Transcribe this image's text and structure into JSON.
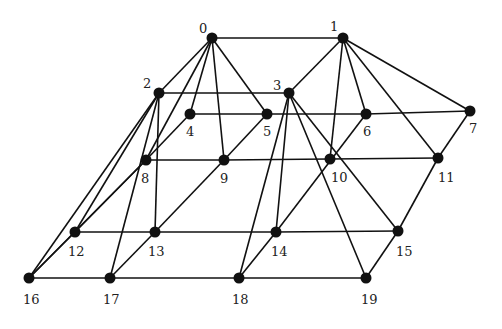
{
  "diagram": {
    "type": "graph",
    "colors": {
      "edge": "#111111",
      "node": "#111111",
      "background": "#ffffff"
    },
    "nodes": [
      {
        "id": "0",
        "label": "0",
        "x": 212,
        "y": 38,
        "lx": 199,
        "ly": 33
      },
      {
        "id": "1",
        "label": "1",
        "x": 343,
        "y": 38,
        "lx": 330,
        "ly": 31
      },
      {
        "id": "2",
        "label": "2",
        "x": 159,
        "y": 93,
        "lx": 143,
        "ly": 88
      },
      {
        "id": "3",
        "label": "3",
        "x": 289,
        "y": 93,
        "lx": 273,
        "ly": 90
      },
      {
        "id": "4",
        "label": "4",
        "x": 190,
        "y": 114,
        "lx": 186,
        "ly": 136
      },
      {
        "id": "5",
        "label": "5",
        "x": 267,
        "y": 114,
        "lx": 263,
        "ly": 136
      },
      {
        "id": "6",
        "label": "6",
        "x": 366,
        "y": 114,
        "lx": 363,
        "ly": 136
      },
      {
        "id": "7",
        "label": "7",
        "x": 470,
        "y": 111,
        "lx": 469,
        "ly": 133
      },
      {
        "id": "8",
        "label": "8",
        "x": 146,
        "y": 160,
        "lx": 141,
        "ly": 183
      },
      {
        "id": "9",
        "label": "9",
        "x": 224,
        "y": 160,
        "lx": 220,
        "ly": 183
      },
      {
        "id": "10",
        "label": "10",
        "x": 330,
        "y": 159,
        "lx": 331,
        "ly": 182
      },
      {
        "id": "11",
        "label": "11",
        "x": 438,
        "y": 158,
        "lx": 438,
        "ly": 182
      },
      {
        "id": "12",
        "label": "12",
        "x": 75,
        "y": 232,
        "lx": 68,
        "ly": 256
      },
      {
        "id": "13",
        "label": "13",
        "x": 155,
        "y": 232,
        "lx": 148,
        "ly": 256
      },
      {
        "id": "14",
        "label": "14",
        "x": 276,
        "y": 232,
        "lx": 271,
        "ly": 256
      },
      {
        "id": "15",
        "label": "15",
        "x": 398,
        "y": 231,
        "lx": 396,
        "ly": 256
      },
      {
        "id": "16",
        "label": "16",
        "x": 29,
        "y": 278,
        "lx": 23,
        "ly": 304
      },
      {
        "id": "17",
        "label": "17",
        "x": 110,
        "y": 278,
        "lx": 103,
        "ly": 304
      },
      {
        "id": "18",
        "label": "18",
        "x": 239,
        "y": 278,
        "lx": 232,
        "ly": 304
      },
      {
        "id": "19",
        "label": "19",
        "x": 366,
        "y": 278,
        "lx": 361,
        "ly": 304
      }
    ],
    "edges": [
      [
        "0",
        "1"
      ],
      [
        "0",
        "2"
      ],
      [
        "0",
        "8"
      ],
      [
        "0",
        "4"
      ],
      [
        "0",
        "9"
      ],
      [
        "0",
        "5"
      ],
      [
        "1",
        "3"
      ],
      [
        "1",
        "10"
      ],
      [
        "1",
        "6"
      ],
      [
        "1",
        "11"
      ],
      [
        "1",
        "7"
      ],
      [
        "2",
        "3"
      ],
      [
        "2",
        "16"
      ],
      [
        "2",
        "12"
      ],
      [
        "2",
        "17"
      ],
      [
        "2",
        "13"
      ],
      [
        "3",
        "18"
      ],
      [
        "3",
        "14"
      ],
      [
        "3",
        "19"
      ],
      [
        "3",
        "15"
      ],
      [
        "4",
        "5"
      ],
      [
        "5",
        "6"
      ],
      [
        "6",
        "7"
      ],
      [
        "4",
        "8"
      ],
      [
        "5",
        "9"
      ],
      [
        "9",
        "13"
      ],
      [
        "6",
        "14"
      ],
      [
        "7",
        "11"
      ],
      [
        "8",
        "9"
      ],
      [
        "9",
        "10"
      ],
      [
        "10",
        "11"
      ],
      [
        "8",
        "12"
      ],
      [
        "8",
        "16"
      ],
      [
        "11",
        "15"
      ],
      [
        "14",
        "18"
      ],
      [
        "13",
        "17"
      ],
      [
        "12",
        "16"
      ],
      [
        "15",
        "19"
      ],
      [
        "12",
        "13"
      ],
      [
        "13",
        "14"
      ],
      [
        "14",
        "15"
      ],
      [
        "16",
        "17"
      ],
      [
        "17",
        "18"
      ],
      [
        "18",
        "19"
      ]
    ]
  }
}
